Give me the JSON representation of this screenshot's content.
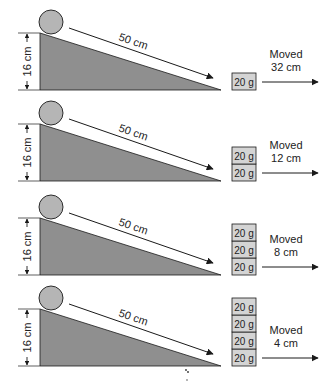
{
  "colors": {
    "ramp_fill": "#8f8f8f",
    "ball_fill": "#b5b5b5",
    "block_fill": "#d4d4d4",
    "line": "#1a1a1a"
  },
  "trials": [
    {
      "height_label": "16 cm",
      "length_label": "50 cm",
      "block_label": "20 g",
      "block_count": 1,
      "moved_line1": "Moved",
      "moved_line2": "32 cm"
    },
    {
      "height_label": "16 cm",
      "length_label": "50 cm",
      "block_label": "20 g",
      "block_count": 2,
      "moved_line1": "Moved",
      "moved_line2": "12 cm"
    },
    {
      "height_label": "16 cm",
      "length_label": "50 cm",
      "block_label": "20 g",
      "block_count": 3,
      "moved_line1": "Moved",
      "moved_line2": "8 cm"
    },
    {
      "height_label": "16 cm",
      "length_label": "50 cm",
      "block_label": "20 g",
      "block_count": 4,
      "moved_line1": "Moved",
      "moved_line2": "4 cm"
    }
  ]
}
